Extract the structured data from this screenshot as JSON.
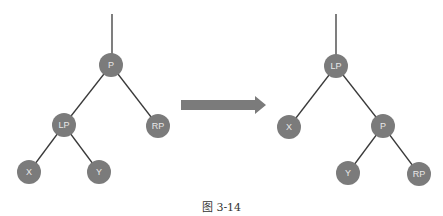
{
  "colors": {
    "node_fill": "#7b7b7b",
    "node_text": "#e8e8e8",
    "edge": "#3a3a3a",
    "arrow": "#7b7b7b"
  },
  "diagram": {
    "left_tree": {
      "root_line": {
        "x": 112,
        "y1": 14,
        "y2": 54
      },
      "nodes": [
        {
          "id": "P",
          "label": "P",
          "x": 111,
          "y": 65
        },
        {
          "id": "LP",
          "label": "LP",
          "x": 64,
          "y": 125
        },
        {
          "id": "RP",
          "label": "RP",
          "x": 158,
          "y": 126
        },
        {
          "id": "X",
          "label": "X",
          "x": 29,
          "y": 172
        },
        {
          "id": "Y",
          "label": "Y",
          "x": 99,
          "y": 172
        }
      ],
      "edges": [
        [
          "P",
          "LP"
        ],
        [
          "P",
          "RP"
        ],
        [
          "LP",
          "X"
        ],
        [
          "LP",
          "Y"
        ]
      ]
    },
    "right_tree": {
      "root_line": {
        "x": 336,
        "y1": 14,
        "y2": 55
      },
      "nodes": [
        {
          "id": "LP",
          "label": "LP",
          "x": 336,
          "y": 66
        },
        {
          "id": "X",
          "label": "X",
          "x": 289,
          "y": 127
        },
        {
          "id": "P",
          "label": "P",
          "x": 383,
          "y": 126
        },
        {
          "id": "Y",
          "label": "Y",
          "x": 348,
          "y": 173
        },
        {
          "id": "RP",
          "label": "RP",
          "x": 419,
          "y": 174
        }
      ],
      "edges": [
        [
          "LP",
          "X"
        ],
        [
          "LP",
          "P"
        ],
        [
          "P",
          "Y"
        ],
        [
          "P",
          "RP"
        ]
      ]
    },
    "arrow": {
      "x1": 181,
      "x2": 266,
      "y": 105
    }
  },
  "caption": "图 3-14"
}
